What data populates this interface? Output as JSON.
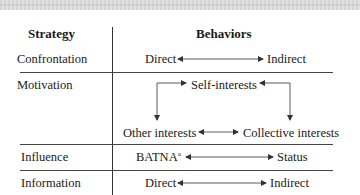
{
  "table": {
    "headers": {
      "strategy": "Strategy",
      "behaviors": "Behaviors"
    },
    "rows": [
      {
        "strategy": "Confrontation",
        "left": "Direct",
        "right": "Indirect",
        "relation": "bidirectional"
      },
      {
        "strategy": "Motivation",
        "top": "Self-interests",
        "bottom_left": "Other interests",
        "bottom_right": "Collective interests",
        "relation": "cycle"
      },
      {
        "strategy": "Influence",
        "left": "BATNA",
        "left_superscript": "a",
        "right": "Status",
        "relation": "bidirectional"
      },
      {
        "strategy": "Information",
        "left": "Direct",
        "right": "Indirect",
        "relation": "bidirectional"
      }
    ]
  }
}
